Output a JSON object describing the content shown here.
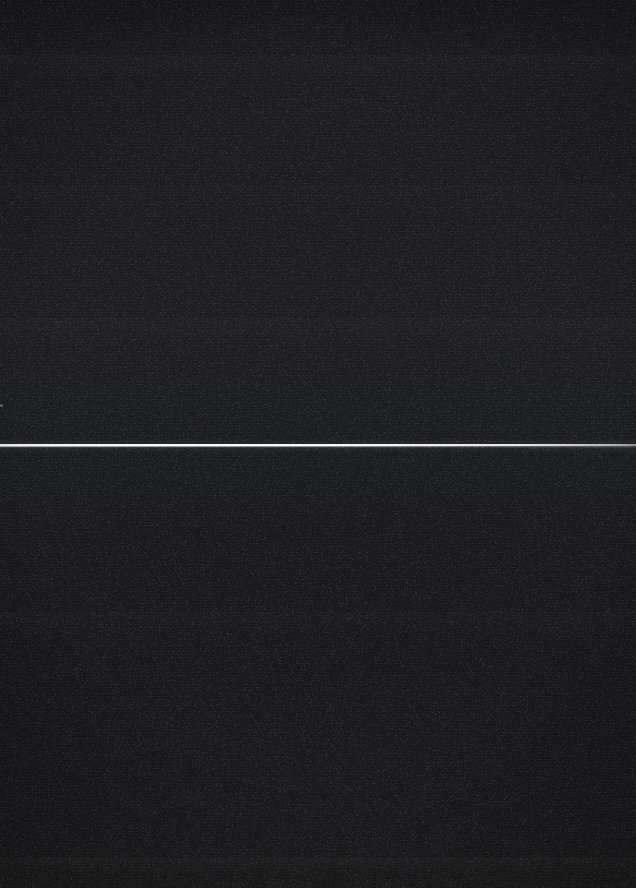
{
  "capture": {
    "width": 636,
    "height": 888,
    "description": "Blank dark screen capture containing no legible interface text or icons",
    "background_upper_hex": "#1a1a1c",
    "background_lower_hex": "#17171a"
  },
  "artifacts": {
    "scanline": {
      "name": "bright-horizontal-scanline",
      "y": 445,
      "thickness_px": 2,
      "x_start": 0,
      "x_end": 636,
      "color_hex": "#fafbfc",
      "falloff": "fades toward right edge"
    },
    "specks": [
      {
        "name": "left-edge-speck",
        "x": 0,
        "y": 404,
        "color_hex": "#ffffff"
      },
      {
        "name": "top-right-speck",
        "x": 612,
        "y": 9,
        "color_hex": "#ffffff"
      }
    ],
    "bands": [
      {
        "name": "band-upper-1",
        "y": 55
      },
      {
        "name": "band-upper-2",
        "y": 185
      },
      {
        "name": "band-upper-3",
        "y": 318
      },
      {
        "name": "band-lower-1",
        "y": 612
      },
      {
        "name": "band-lower-2",
        "y": 858
      }
    ]
  }
}
